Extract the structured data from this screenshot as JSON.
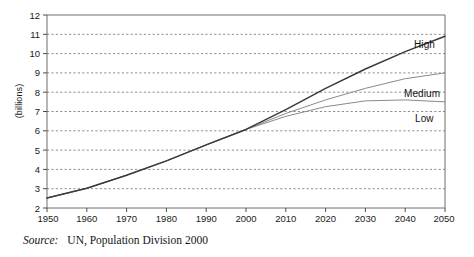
{
  "chart_data": {
    "type": "line",
    "title": "",
    "subtitle": "",
    "xlabel": "",
    "ylabel": "(billions)",
    "xlim": [
      1950,
      2050
    ],
    "ylim": [
      2,
      12
    ],
    "grid": true,
    "grid_axis": "y",
    "legend_position": "end-of-line labels",
    "x_ticks": [
      1950,
      1960,
      1970,
      1980,
      1990,
      2000,
      2010,
      2020,
      2030,
      2040,
      2050
    ],
    "y_ticks": [
      2,
      3,
      4,
      5,
      6,
      7,
      8,
      9,
      10,
      11,
      12
    ],
    "x": [
      1950,
      1960,
      1970,
      1980,
      1990,
      2000,
      2010,
      2020,
      2030,
      2040,
      2050
    ],
    "series": [
      {
        "name": "High",
        "color": "#3a3a3a",
        "width": 1.5,
        "values": [
          2.52,
          3.02,
          3.7,
          4.44,
          5.27,
          6.07,
          7.1,
          8.2,
          9.2,
          10.1,
          10.9
        ]
      },
      {
        "name": "Medium",
        "color": "#8a8a8a",
        "width": 1.0,
        "values": [
          2.52,
          3.02,
          3.7,
          4.44,
          5.27,
          6.07,
          6.9,
          7.6,
          8.2,
          8.7,
          9.0
        ]
      },
      {
        "name": "Low",
        "color": "#8a8a8a",
        "width": 1.0,
        "values": [
          2.52,
          3.02,
          3.7,
          4.44,
          5.27,
          6.07,
          6.75,
          7.25,
          7.55,
          7.6,
          7.5
        ]
      }
    ],
    "annotations": [
      {
        "text": "High",
        "x": 2050,
        "y": 10.9
      },
      {
        "text": "Medium",
        "x": 2050,
        "y": 9.0
      },
      {
        "text": "Low",
        "x": 2050,
        "y": 7.5
      }
    ]
  },
  "axes": {
    "y_title": "(billions)",
    "y_tick_labels": [
      "12",
      "11",
      "10",
      "9",
      "8",
      "7",
      "6",
      "5",
      "4",
      "3",
      "2"
    ],
    "x_tick_labels": [
      "1950",
      "1960",
      "1970",
      "1980",
      "1990",
      "2000",
      "2010",
      "2020",
      "2030",
      "2040",
      "2050"
    ]
  },
  "labels": {
    "high": "High",
    "medium": "Medium",
    "low": "Low"
  },
  "caption": {
    "source_label": "Source:",
    "source_text": "UN, Population Division 2000"
  },
  "colors": {
    "high_line": "#3a3a3a",
    "medium_line": "#8a8a8a",
    "low_line": "#8a8a8a",
    "grid": "#707070",
    "axis": "#6e6e6e",
    "background": "#ffffff",
    "text": "#1a1a1a"
  }
}
